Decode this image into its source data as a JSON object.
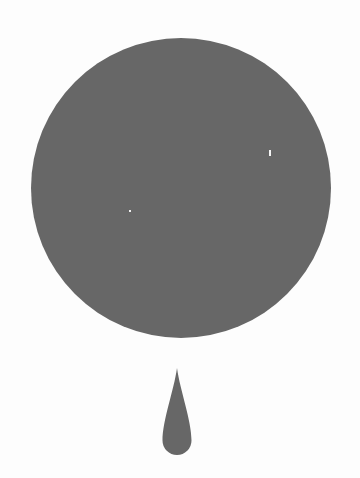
{
  "illustration": {
    "background_color": "#fdfdfd",
    "shape_color": "#676767",
    "circle": {
      "cx": 181,
      "cy": 188,
      "r": 150
    },
    "drop": {
      "tip_x": 177,
      "tip_y": 368,
      "bottom_y": 455,
      "half_width": 14.5
    },
    "specks": [
      {
        "x": 269,
        "y": 150,
        "w": 2,
        "h": 6
      },
      {
        "x": 129,
        "y": 210,
        "w": 2,
        "h": 2
      }
    ]
  }
}
